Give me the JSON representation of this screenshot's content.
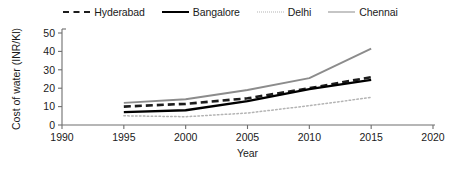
{
  "chart_data": {
    "type": "line",
    "title": "",
    "xlabel": "Year",
    "ylabel": "Cost of water (INR/Kl)",
    "xlim": [
      1990,
      2020
    ],
    "ylim": [
      0,
      50
    ],
    "xticks": [
      "1990",
      "1995",
      "2000",
      "2005",
      "2010",
      "2015",
      "2020"
    ],
    "yticks": [
      "0",
      "10",
      "20",
      "30",
      "40",
      "50"
    ],
    "grid": false,
    "legend_position": "top-center",
    "x": [
      1995,
      2000,
      2005,
      2010,
      2015
    ],
    "series": [
      {
        "name": "Hyderabad",
        "style": "dashed",
        "color": "#1c1c1c",
        "width": 2.6,
        "values": [
          10,
          11.5,
          14.5,
          20,
          26
        ]
      },
      {
        "name": "Bangalore",
        "style": "solid",
        "color": "#000000",
        "width": 2.4,
        "values": [
          7,
          8,
          13,
          19.5,
          24.5
        ]
      },
      {
        "name": "Delhi",
        "style": "dotted",
        "color": "#b4b4b4",
        "width": 1.5,
        "values": [
          5,
          4.5,
          6.5,
          10.5,
          15
        ]
      },
      {
        "name": "Chennai",
        "style": "solid",
        "color": "#8c8c8c",
        "width": 1.9,
        "values": [
          12,
          14,
          19,
          25.5,
          41.5
        ]
      }
    ]
  },
  "legend": {
    "entries": [
      {
        "label": "Hyderabad"
      },
      {
        "label": "Bangalore"
      },
      {
        "label": "Delhi"
      },
      {
        "label": "Chennai"
      }
    ]
  },
  "axes": {
    "x_title": "Year",
    "y_title": "Cost of water (INR/Kl)",
    "x_tick_labels": [
      "1990",
      "1995",
      "2000",
      "2005",
      "2010",
      "2015",
      "2020"
    ],
    "y_tick_labels": [
      "0",
      "10",
      "20",
      "30",
      "40",
      "50"
    ]
  }
}
